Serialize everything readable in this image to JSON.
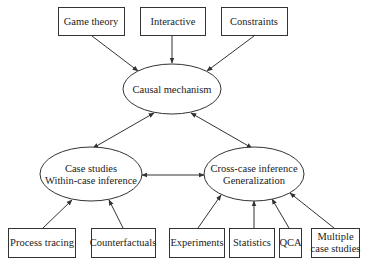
{
  "diagram": {
    "type": "flow",
    "nodes": [
      {
        "id": "game_theory",
        "label": "Game theory",
        "shape": "box",
        "x": 58,
        "y": 7,
        "w": 66,
        "h": 28
      },
      {
        "id": "interactive",
        "label": "Interactive",
        "shape": "box",
        "x": 140,
        "y": 7,
        "w": 65,
        "h": 28
      },
      {
        "id": "constraints",
        "label": "Constraints",
        "shape": "box",
        "x": 221,
        "y": 7,
        "w": 66,
        "h": 28
      },
      {
        "id": "causal_mechanism",
        "label": "Causal mechanism",
        "shape": "ellipse",
        "cx": 172,
        "cy": 89,
        "rx": 49,
        "ry": 25
      },
      {
        "id": "case_studies",
        "label_line1": "Case studies",
        "label_line2": "Within-case inference",
        "shape": "ellipse",
        "cx": 91,
        "cy": 174,
        "rx": 51,
        "ry": 27
      },
      {
        "id": "cross_case",
        "label_line1": "Cross-case inference",
        "label_line2": "Generalization",
        "shape": "ellipse",
        "cx": 254,
        "cy": 174,
        "rx": 50,
        "ry": 27
      },
      {
        "id": "process_tracing",
        "label": "Process tracing",
        "shape": "box",
        "x": 8,
        "y": 228,
        "w": 67,
        "h": 29
      },
      {
        "id": "counterfactuals",
        "label": "Counterfactuals",
        "shape": "box",
        "x": 91,
        "y": 228,
        "w": 64,
        "h": 29
      },
      {
        "id": "experiments",
        "label": "Experiments",
        "shape": "box",
        "x": 169,
        "y": 228,
        "w": 55,
        "h": 29
      },
      {
        "id": "statistics",
        "label": "Statistics",
        "shape": "box",
        "x": 229,
        "y": 228,
        "w": 45,
        "h": 29
      },
      {
        "id": "qca",
        "label": "QCA",
        "shape": "box",
        "x": 279,
        "y": 228,
        "w": 22,
        "h": 29
      },
      {
        "id": "multiple_case_studies",
        "label_line1": "Multiple",
        "label_line2": "case studies",
        "shape": "box",
        "x": 311,
        "y": 228,
        "w": 48,
        "h": 29
      }
    ],
    "edges": [
      {
        "from": "game_theory",
        "to": "causal_mechanism",
        "directed": true
      },
      {
        "from": "interactive",
        "to": "causal_mechanism",
        "directed": true
      },
      {
        "from": "constraints",
        "to": "causal_mechanism",
        "directed": true
      },
      {
        "from": "causal_mechanism",
        "to": "case_studies",
        "bidirectional": true
      },
      {
        "from": "causal_mechanism",
        "to": "cross_case",
        "bidirectional": true
      },
      {
        "from": "case_studies",
        "to": "cross_case",
        "bidirectional": true
      },
      {
        "from": "process_tracing",
        "to": "case_studies",
        "directed": true
      },
      {
        "from": "counterfactuals",
        "to": "case_studies",
        "directed": true
      },
      {
        "from": "experiments",
        "to": "cross_case",
        "directed": true
      },
      {
        "from": "statistics",
        "to": "cross_case",
        "directed": true
      },
      {
        "from": "qca",
        "to": "cross_case",
        "directed": true
      },
      {
        "from": "multiple_case_studies",
        "to": "cross_case",
        "directed": true
      }
    ]
  },
  "labels": {
    "game_theory": "Game theory",
    "interactive": "Interactive",
    "constraints": "Constraints",
    "causal_mechanism": "Causal mechanism",
    "case_studies_1": "Case studies",
    "case_studies_2": "Within-case inference",
    "cross_case_1": "Cross-case inference",
    "cross_case_2": "Generalization",
    "process_tracing": "Process tracing",
    "counterfactuals": "Counterfactuals",
    "experiments": "Experiments",
    "statistics": "Statistics",
    "qca": "QCA",
    "multiple_1": "Multiple",
    "multiple_2": "case studies"
  },
  "colors": {
    "stroke": "#333333",
    "text": "#222222",
    "background": "#ffffff"
  }
}
